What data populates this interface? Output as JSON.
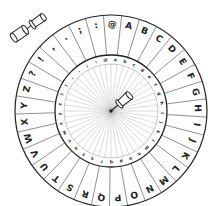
{
  "image": {
    "subject": "cipher wheel",
    "colors": {
      "line": "#222222",
      "spoke": "#9a9a9a",
      "background": "#ffffff"
    }
  },
  "wheel": {
    "center": [
      111,
      111
    ],
    "outer_radius": 96,
    "inner_ring_outer_radius": 56,
    "inner_ring_inner_radius": 47,
    "outer_ring": {
      "characters": [
        ":",
        "@",
        "A",
        "B",
        "C",
        "D",
        "E",
        "F",
        "G",
        "H",
        "I",
        "J",
        "K",
        "L",
        "M",
        "N",
        "O",
        "P",
        "Q",
        "R",
        "S",
        "T",
        "U",
        "V",
        "W",
        "X",
        "Y",
        "Z",
        "?",
        "!",
        ",",
        ".",
        ";"
      ],
      "start_angle_deg": -100
    },
    "inner_ring": {
      "characters": [
        "@",
        "a",
        "b",
        "c",
        "d",
        "e",
        "f",
        "g",
        "h",
        "i",
        "j",
        "k",
        "l",
        "m",
        "n",
        "o",
        "p",
        "q",
        "r",
        "s",
        "t",
        "u",
        "v",
        "w",
        "x",
        "y",
        "z",
        "?",
        "!",
        ",",
        ".",
        ";",
        ":"
      ],
      "start_angle_deg": -96
    },
    "spoke_count": 48
  },
  "pins": [
    {
      "name": "split-pin-loose",
      "position": "top-left"
    },
    {
      "name": "split-pin-center",
      "position": "center"
    }
  ]
}
